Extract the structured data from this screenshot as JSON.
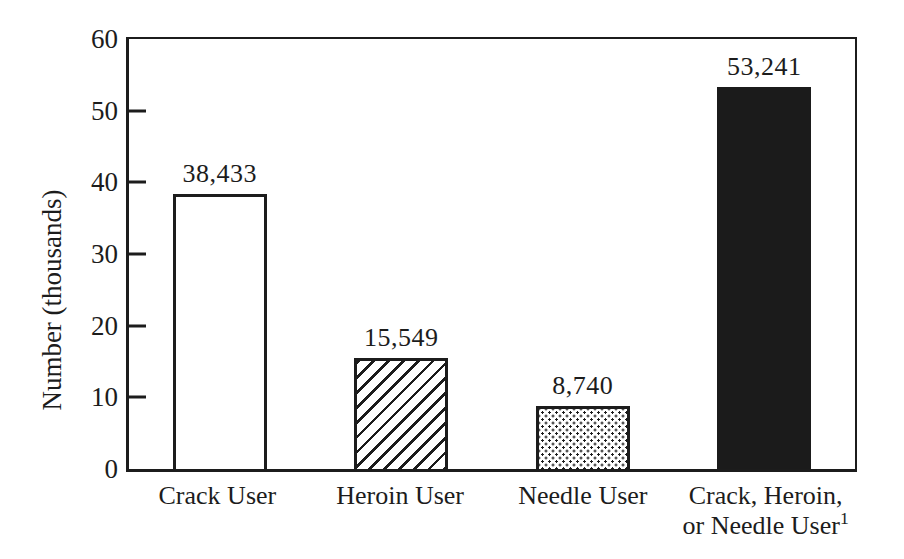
{
  "colors": {
    "ink": "#1c1c1c",
    "paper": "#ffffff"
  },
  "chart_data": {
    "type": "bar",
    "title": "",
    "xlabel": "",
    "ylabel": "Number (thousands)",
    "ylim": [
      0,
      60
    ],
    "yticks": [
      0,
      10,
      20,
      30,
      40,
      50,
      60
    ],
    "grid": false,
    "legend": "none",
    "categories": [
      {
        "lines": [
          "Crack User"
        ]
      },
      {
        "lines": [
          "Heroin User"
        ]
      },
      {
        "lines": [
          "Needle User"
        ]
      },
      {
        "lines": [
          "Crack, Heroin,",
          "or Needle User"
        ],
        "superscript": "1"
      }
    ],
    "values": [
      38433,
      15549,
      8740,
      53241
    ],
    "values_axis_units_thousands": [
      38.433,
      15.549,
      8.74,
      53.241
    ],
    "value_labels": [
      "38,433",
      "15,549",
      "8,740",
      "53,241"
    ],
    "bar_fills": [
      "plain-white",
      "diagonal-hatch",
      "stipple-dots",
      "solid-black"
    ]
  }
}
